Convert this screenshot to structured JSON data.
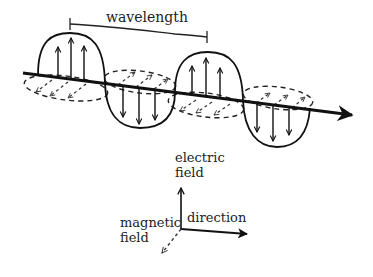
{
  "diagram": {
    "type": "electromagnetic-wave",
    "wave_labels": {
      "wavelength": "wavelength"
    },
    "legend": {
      "electric_line1": "electric",
      "electric_line2": "field",
      "magnetic_line1": "magnetic",
      "magnetic_line2": "field",
      "direction": "direction"
    },
    "colors": {
      "ink": "#111111",
      "background": "#ffffff"
    }
  }
}
